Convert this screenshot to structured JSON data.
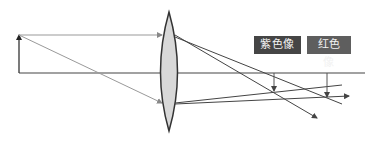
{
  "diagram": {
    "labels": {
      "purple_image": "紫色像",
      "red_image": "红色像"
    },
    "colors": {
      "background": "#ffffff",
      "lines": "#444444",
      "incident_rays": "#8a8a8a",
      "lens_fill": "#d8d8d8",
      "lens_stroke": "#333333",
      "purple_label_bg": "#454545",
      "red_label_bg": "#5e5e5e",
      "label_text": "#f2f2f2"
    },
    "elements": {
      "object_arrow": "upright object arrow at left",
      "lens": "biconvex lens",
      "principal_axis": "horizontal optical axis",
      "purple_image_arrow": "inverted image (purple, nearer)",
      "red_image_arrow": "inverted image (red, farther)"
    }
  }
}
